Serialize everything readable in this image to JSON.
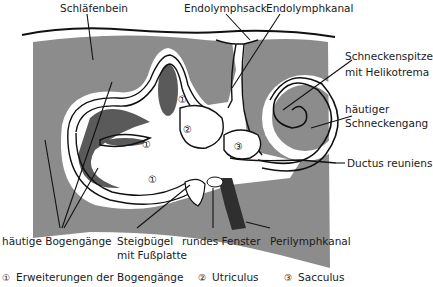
{
  "diagram": {
    "colors": {
      "bone": "#8c8c8c",
      "dark_cavity": "#5a5a5a",
      "perilymph_dark": "#3a3a3a",
      "membrane": "#ffffff",
      "outline": "#111111"
    },
    "labels": {
      "schlaefenbein": "Schläfenbein",
      "endolymphsack": "Endolymphsack",
      "endolymphkanal": "Endolymphkanal",
      "schneckenspitze_1": "Schneckenspitze",
      "schneckenspitze_2": "mit Helikotrema",
      "schneckengang_1": "häutiger",
      "schneckengang_2": "Schneckengang",
      "ductus": "Ductus reuniens",
      "bogengaenge": "häutige Bogengänge",
      "steigbuegel_1": "Steigbügel",
      "steigbuegel_2": "mit Fußplatte",
      "fenster": "rundes Fenster",
      "perilymphkanal": "Perilymphkanal"
    },
    "markers": {
      "m1": "①",
      "m2": "②",
      "m3": "③"
    },
    "legend": [
      {
        "num": "①",
        "text": "Erweiterungen der Bogengänge"
      },
      {
        "num": "②",
        "text": "Utriculus"
      },
      {
        "num": "③",
        "text": "Sacculus"
      }
    ]
  }
}
